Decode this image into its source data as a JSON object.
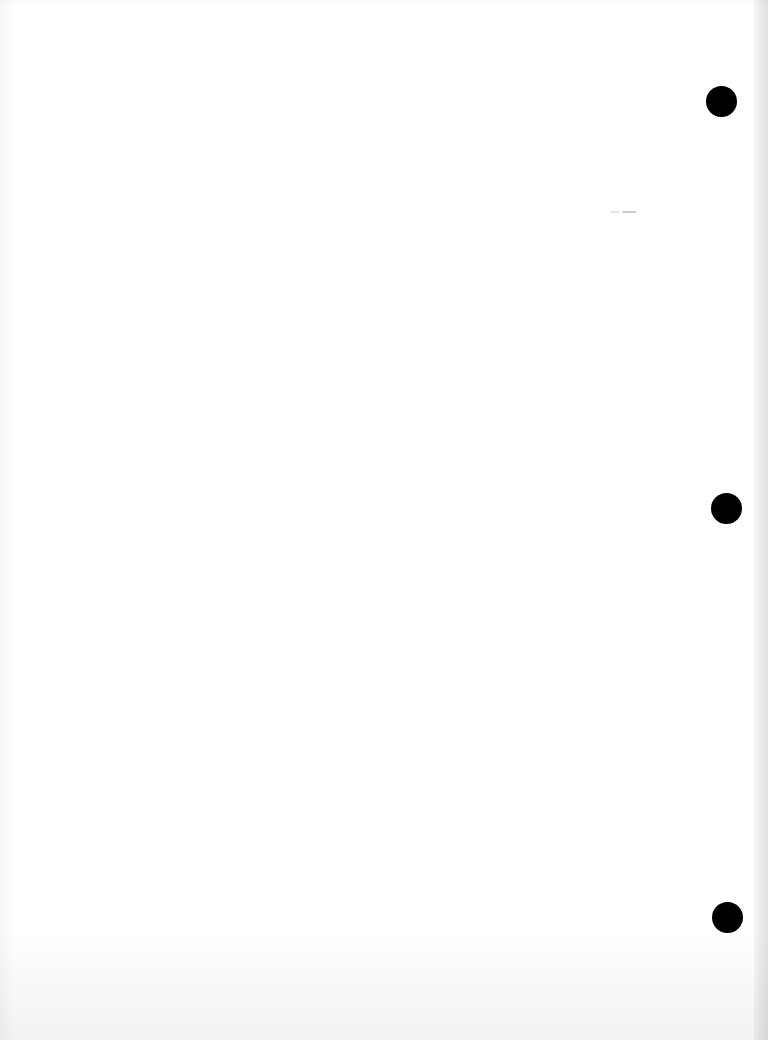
{
  "document": {
    "type": "blank scanned page",
    "text_content": "",
    "background_color": "#ffffff",
    "hole_punches": [
      {
        "cx": 721,
        "cy": 101,
        "diameter": 31,
        "color": "#000000"
      },
      {
        "cx": 726,
        "cy": 508,
        "diameter": 31,
        "color": "#000000"
      },
      {
        "cx": 727,
        "cy": 917,
        "diameter": 31,
        "color": "#000000"
      }
    ],
    "specks": [
      {
        "x": 608,
        "y": 211,
        "w": 28
      }
    ]
  }
}
